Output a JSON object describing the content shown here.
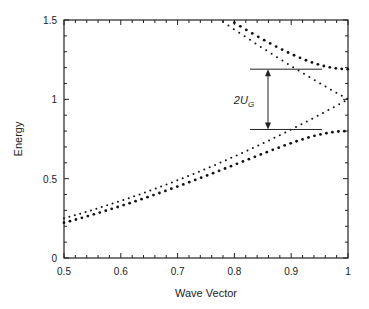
{
  "chart_data": {
    "type": "scatter",
    "title": "",
    "xlabel": "Wave Vector",
    "ylabel": "Energy",
    "xlim": [
      0.5,
      1
    ],
    "ylim": [
      0,
      1.5
    ],
    "x_ticks": [
      "0.5",
      "0.6",
      "0.7",
      "0.8",
      "0.9",
      "1"
    ],
    "y_ticks": [
      "0",
      "0.5",
      "1",
      "1.5"
    ],
    "grid": false,
    "legend": null,
    "annotation": {
      "label": "2U",
      "subscript": "G",
      "gap_upper": 1.19,
      "gap_lower": 0.81,
      "description": "band gap 2U_G between horizontal lines"
    },
    "series": [
      {
        "name": "free-electron lower (k^2)",
        "style": "small dots",
        "x": [
          0.5,
          0.55,
          0.6,
          0.65,
          0.7,
          0.75,
          0.8,
          0.85,
          0.9,
          0.95,
          1.0
        ],
        "y": [
          0.25,
          0.3025,
          0.36,
          0.4225,
          0.49,
          0.5625,
          0.64,
          0.7225,
          0.81,
          0.9025,
          1.0
        ]
      },
      {
        "name": "free-electron upper ((2-k)^2)",
        "style": "small dots",
        "x": [
          0.78,
          0.8,
          0.85,
          0.9,
          0.95,
          1.0
        ],
        "y": [
          1.4884,
          1.44,
          1.3225,
          1.21,
          1.1025,
          1.0
        ]
      },
      {
        "name": "lower band (with gap)",
        "style": "large dots",
        "x": [
          0.5,
          0.55,
          0.6,
          0.65,
          0.7,
          0.75,
          0.8,
          0.85,
          0.9,
          0.95,
          1.0
        ],
        "y": [
          0.24,
          0.29,
          0.345,
          0.4,
          0.46,
          0.52,
          0.585,
          0.65,
          0.72,
          0.77,
          0.79
        ]
      },
      {
        "name": "upper band (with gap)",
        "style": "large dots",
        "x": [
          0.81,
          0.85,
          0.9,
          0.95,
          1.0
        ],
        "y": [
          1.5,
          1.42,
          1.32,
          1.23,
          1.2
        ]
      }
    ]
  }
}
